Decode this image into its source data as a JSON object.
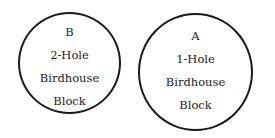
{
  "circles": [
    {
      "id": "B",
      "letter": "B",
      "lines": [
        "2-Hole",
        "Birdhouse",
        "Block"
      ]
    },
    {
      "id": "A",
      "letter": "A",
      "lines": [
        "1-Hole",
        "Birdhouse",
        "Block"
      ]
    }
  ],
  "colors": {
    "stroke": "#1a1a1a",
    "text": "#222222",
    "background": "#ffffff"
  }
}
